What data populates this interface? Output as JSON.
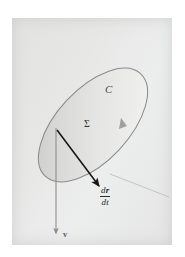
{
  "figure": {
    "type": "vector-calculus-diagram",
    "background_color": "#ffffff",
    "panel_color": "#e7e8e6",
    "labels": {
      "curve": "C",
      "surface": "Σ",
      "velocity_field": "v",
      "derivative_numerator_d": "d",
      "derivative_numerator_r": "r",
      "derivative_denominator_d": "d",
      "derivative_denominator_t": "t"
    },
    "elements": {
      "ellipse": {
        "name": "surface-sigma",
        "center_x": 93,
        "center_y": 125,
        "radius_x": 70,
        "radius_y": 36,
        "rotation_deg": -47,
        "stroke": "#8a8a8a",
        "fill_light": "#eceded",
        "fill_dark": "#c9cac8"
      },
      "orientation_arrow": {
        "name": "orientation-marker",
        "x": 124,
        "y": 124,
        "color": "#9a9a9a"
      },
      "tangent_vector": {
        "name": "dr-dt-vector",
        "x1": 57,
        "y1": 130,
        "x2": 100,
        "y2": 188,
        "color": "#161616"
      },
      "tangent_line": {
        "name": "tangent-line",
        "x1": 112,
        "y1": 175,
        "x2": 168,
        "y2": 196,
        "color": "#b5b6b4"
      },
      "velocity_vector": {
        "name": "v-vector",
        "x1": 56,
        "y1": 128,
        "x2": 56,
        "y2": 236,
        "color": "#8d8e8c"
      }
    }
  }
}
